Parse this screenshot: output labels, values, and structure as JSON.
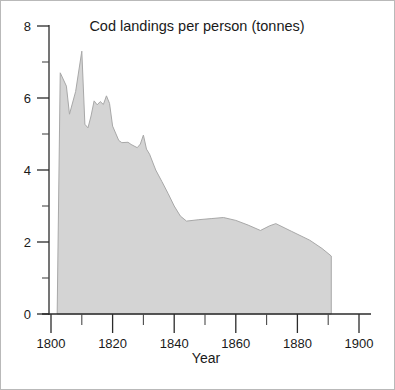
{
  "chart_data": {
    "type": "area",
    "title": "Cod landings per person (tonnes)",
    "xlabel": "Year",
    "ylabel": "",
    "xlim": [
      1800,
      1900
    ],
    "ylim": [
      0,
      8
    ],
    "grid": false,
    "legend": null,
    "fill_color": "#d4d4d4",
    "line_color": "#a8a8a8",
    "axis_color": "#2b2b2b",
    "xticks": [
      1800,
      1820,
      1840,
      1860,
      1880,
      1900
    ],
    "xtick_labels": [
      "1800",
      "1820",
      "1840",
      "1860",
      "1880",
      "1900"
    ],
    "xticks_minor": [
      1810,
      1830,
      1850,
      1870,
      1890
    ],
    "yticks": [
      0,
      2,
      4,
      6,
      8
    ],
    "ytick_labels": [
      "0",
      "2",
      "4",
      "6",
      "8"
    ],
    "yticks_minor": [
      1,
      3,
      5,
      7
    ],
    "x": [
      1802,
      1803,
      1805,
      1806,
      1808,
      1810,
      1811,
      1812,
      1813,
      1814,
      1815,
      1816,
      1817,
      1818,
      1819,
      1820,
      1822,
      1823,
      1825,
      1826,
      1828,
      1829,
      1830,
      1831,
      1832,
      1834,
      1836,
      1838,
      1840,
      1842,
      1844,
      1848,
      1852,
      1856,
      1860,
      1864,
      1868,
      1871,
      1873,
      1878,
      1884,
      1888,
      1891
    ],
    "values": [
      0.0,
      6.7,
      6.33,
      5.55,
      6.18,
      7.3,
      5.27,
      5.17,
      5.5,
      5.92,
      5.81,
      5.9,
      5.82,
      6.06,
      5.85,
      5.22,
      4.82,
      4.76,
      4.77,
      4.71,
      4.62,
      4.72,
      4.97,
      4.58,
      4.44,
      4.0,
      3.68,
      3.35,
      3.0,
      2.72,
      2.58,
      2.62,
      2.65,
      2.68,
      2.6,
      2.47,
      2.32,
      2.45,
      2.51,
      2.3,
      2.05,
      1.82,
      1.61
    ]
  },
  "footer": {}
}
